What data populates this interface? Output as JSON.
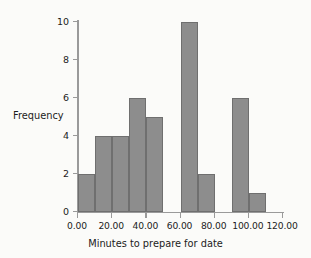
{
  "chart_data": {
    "type": "bar",
    "title": "",
    "xlabel": "Minutes to prepare for date",
    "ylabel": "Frequency",
    "xlim": [
      0,
      120
    ],
    "ylim": [
      0,
      10
    ],
    "grid": false,
    "legend": null,
    "bin_width": 10,
    "bar_color": "#8d8d8d",
    "bar_border_color": "#6f6f6f",
    "background_color": "#fbfbf9",
    "axis_color": "#9a9a9a",
    "xticks": [
      {
        "value": 0,
        "label": "0.00"
      },
      {
        "value": 20,
        "label": "20.00"
      },
      {
        "value": 40,
        "label": "40.00"
      },
      {
        "value": 60,
        "label": "60.00"
      },
      {
        "value": 80,
        "label": "80.00"
      },
      {
        "value": 100,
        "label": "100.00"
      },
      {
        "value": 120,
        "label": "120.00"
      }
    ],
    "yticks": [
      {
        "value": 0,
        "label": "0"
      },
      {
        "value": 2,
        "label": "2"
      },
      {
        "value": 4,
        "label": "4"
      },
      {
        "value": 6,
        "label": "6"
      },
      {
        "value": 8,
        "label": "8"
      },
      {
        "value": 10,
        "label": "10"
      }
    ],
    "categories": [
      "0-10",
      "10-20",
      "20-30",
      "30-40",
      "40-50",
      "50-60",
      "60-70",
      "70-80",
      "80-90",
      "90-100",
      "100-110",
      "110-120"
    ],
    "bins": [
      {
        "start": 0,
        "end": 10,
        "value": 2
      },
      {
        "start": 10,
        "end": 20,
        "value": 4
      },
      {
        "start": 20,
        "end": 30,
        "value": 4
      },
      {
        "start": 30,
        "end": 40,
        "value": 6
      },
      {
        "start": 40,
        "end": 50,
        "value": 5
      },
      {
        "start": 50,
        "end": 60,
        "value": 0
      },
      {
        "start": 60,
        "end": 70,
        "value": 10
      },
      {
        "start": 70,
        "end": 80,
        "value": 2
      },
      {
        "start": 80,
        "end": 90,
        "value": 0
      },
      {
        "start": 90,
        "end": 100,
        "value": 6
      },
      {
        "start": 100,
        "end": 110,
        "value": 1
      },
      {
        "start": 110,
        "end": 120,
        "value": 0
      }
    ],
    "values": [
      2,
      4,
      4,
      6,
      5,
      0,
      10,
      2,
      0,
      6,
      1,
      0
    ]
  }
}
